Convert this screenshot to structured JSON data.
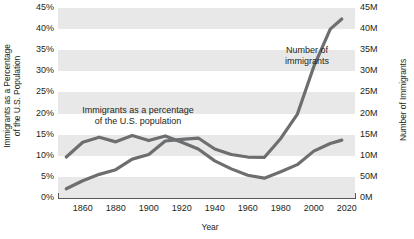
{
  "chart_data": {
    "type": "line",
    "title": "",
    "subtitle": "",
    "xlabel": "Year",
    "grid": true,
    "legend_position": "inline-annotations",
    "x": [
      1850,
      1860,
      1870,
      1880,
      1890,
      1900,
      1910,
      1920,
      1930,
      1940,
      1950,
      1960,
      1970,
      1980,
      1990,
      2000,
      2010,
      2017
    ],
    "xlim": [
      1845,
      2025
    ],
    "x_ticks": [
      "1860",
      "1880",
      "1900",
      "1920",
      "1940",
      "1960",
      "1980",
      "2000",
      "2020"
    ],
    "x_tick_values": [
      1860,
      1880,
      1900,
      1920,
      1940,
      1960,
      1980,
      2000,
      2020
    ],
    "axes": [
      {
        "id": "left",
        "label_line1": "Immigrants as a Percentage",
        "label_line2": "of the U.S. Population",
        "ticks": [
          "0%",
          "5%",
          "10%",
          "15%",
          "20%",
          "25%",
          "30%",
          "35%",
          "40%",
          "45%"
        ],
        "tick_values": [
          0,
          5,
          10,
          15,
          20,
          25,
          30,
          35,
          40,
          45
        ],
        "ylim": [
          0,
          45
        ]
      },
      {
        "id": "right",
        "label": "Number of Immigrants",
        "ticks": [
          "0M",
          "50M",
          "10M",
          "15M",
          "20M",
          "25M",
          "30M",
          "35M",
          "40M",
          "45M"
        ],
        "tick_values": [
          0,
          5,
          10,
          15,
          20,
          25,
          30,
          35,
          40,
          45
        ],
        "ylim": [
          0,
          45
        ]
      }
    ],
    "series": [
      {
        "name": "Immigrants as a percentage of the U.S. population",
        "axis": "left",
        "unit": "percent",
        "color": "#6d6e70",
        "annotation_line1": "Immigrants as a percentage",
        "annotation_line2": "of the U.S. population",
        "values": [
          9.7,
          13.2,
          14.4,
          13.3,
          14.8,
          13.6,
          14.7,
          13.2,
          11.6,
          8.8,
          6.9,
          5.4,
          4.7,
          6.2,
          7.9,
          11.1,
          12.9,
          13.7
        ]
      },
      {
        "name": "Number of immigrants",
        "axis": "right",
        "unit": "millions",
        "color": "#6d6e70",
        "annotation_line1": "Number of",
        "annotation_line2": "immigrants",
        "values": [
          2.2,
          4.1,
          5.6,
          6.7,
          9.2,
          10.3,
          13.5,
          13.9,
          14.2,
          11.6,
          10.3,
          9.7,
          9.6,
          14.1,
          19.8,
          31.1,
          40.0,
          42.4
        ]
      }
    ]
  }
}
